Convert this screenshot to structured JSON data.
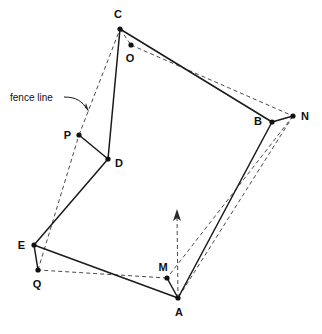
{
  "figure": {
    "background_color": "#ffffff",
    "solid_stroke_color": "#1a1a1a",
    "dashed_stroke_color": "#4a4a4a",
    "width": 322,
    "height": 334
  },
  "annotations": {
    "fence_line_label": "fence line"
  },
  "vertices": [
    {
      "label": "A",
      "x": 178,
      "y": 298,
      "label_x": 179,
      "label_y": 316,
      "anchor": "middle"
    },
    {
      "label": "B",
      "x": 272,
      "y": 122,
      "label_x": 262,
      "label_y": 125,
      "anchor": "end"
    },
    {
      "label": "C",
      "x": 120,
      "y": 29,
      "label_x": 118,
      "label_y": 18,
      "anchor": "middle"
    },
    {
      "label": "D",
      "x": 108,
      "y": 159,
      "label_x": 115,
      "label_y": 167,
      "anchor": "start"
    },
    {
      "label": "E",
      "x": 34,
      "y": 245,
      "label_x": 25,
      "label_y": 249,
      "anchor": "end"
    },
    {
      "label": "M",
      "x": 167,
      "y": 278,
      "label_x": 163,
      "label_y": 271,
      "anchor": "middle"
    },
    {
      "label": "N",
      "x": 293,
      "y": 116,
      "label_x": 301,
      "label_y": 120,
      "anchor": "start"
    },
    {
      "label": "O",
      "x": 131,
      "y": 45,
      "label_x": 130,
      "label_y": 62,
      "anchor": "middle"
    },
    {
      "label": "P",
      "x": 79,
      "y": 135,
      "label_x": 71,
      "label_y": 139,
      "anchor": "end"
    },
    {
      "label": "Q",
      "x": 38,
      "y": 270,
      "label_x": 37,
      "label_y": 288,
      "anchor": "middle"
    }
  ],
  "solid_edges": [
    {
      "name": "edge-C-B",
      "from": "C",
      "to": "B",
      "x1": 120,
      "y1": 29,
      "x2": 272,
      "y2": 122
    },
    {
      "name": "edge-B-N",
      "from": "B",
      "to": "N",
      "x1": 272,
      "y1": 122,
      "x2": 293,
      "y2": 116
    },
    {
      "name": "edge-B-A",
      "from": "B",
      "to": "A",
      "x1": 272,
      "y1": 122,
      "x2": 178,
      "y2": 298
    },
    {
      "name": "edge-A-M",
      "from": "A",
      "to": "M",
      "x1": 178,
      "y1": 298,
      "x2": 167,
      "y2": 278
    },
    {
      "name": "edge-A-E",
      "from": "A",
      "to": "E",
      "x1": 178,
      "y1": 298,
      "x2": 34,
      "y2": 245
    },
    {
      "name": "edge-E-Q",
      "from": "E",
      "to": "Q",
      "x1": 34,
      "y1": 245,
      "x2": 38,
      "y2": 270
    },
    {
      "name": "edge-E-D",
      "from": "E",
      "to": "D",
      "x1": 34,
      "y1": 245,
      "x2": 108,
      "y2": 159
    },
    {
      "name": "edge-D-P",
      "from": "D",
      "to": "P",
      "x1": 108,
      "y1": 159,
      "x2": 79,
      "y2": 135
    },
    {
      "name": "edge-D-C",
      "from": "D",
      "to": "C",
      "x1": 108,
      "y1": 159,
      "x2": 120,
      "y2": 29
    }
  ],
  "dashed_edges": [
    {
      "name": "dashed-C-O",
      "from": "C",
      "to": "O",
      "x1": 120,
      "y1": 29,
      "x2": 131,
      "y2": 45
    },
    {
      "name": "dashed-O-N",
      "from": "O",
      "to": "N",
      "x1": 131,
      "y1": 45,
      "x2": 293,
      "y2": 116
    },
    {
      "name": "dashed-N-A",
      "from": "N",
      "to": "A",
      "x1": 293,
      "y1": 116,
      "x2": 178,
      "y2": 298
    },
    {
      "name": "dashed-N-M",
      "from": "N",
      "to": "M",
      "x1": 293,
      "y1": 116,
      "x2": 167,
      "y2": 278
    },
    {
      "name": "dashed-M-Q",
      "from": "M",
      "to": "Q",
      "x1": 167,
      "y1": 278,
      "x2": 38,
      "y2": 270
    },
    {
      "name": "dashed-Q-P",
      "from": "Q",
      "to": "P",
      "x1": 38,
      "y1": 270,
      "x2": 79,
      "y2": 135
    },
    {
      "name": "dashed-P-C",
      "from": "P",
      "to": "C",
      "x1": 79,
      "y1": 135,
      "x2": 120,
      "y2": 29
    }
  ],
  "north_arrow": {
    "name": "north-arrow",
    "shaft_x1": 178,
    "shaft_y1": 298,
    "shaft_x2": 177,
    "shaft_y2": 214,
    "head_points": "177,209 173,221 177,218 181,221"
  },
  "leader": {
    "name": "fence-line-leader",
    "path": "M 64 97 C 76 97, 82 101, 88 110",
    "head_points": "89,112 82,104 85,107 86,103"
  },
  "label_position": {
    "fence_line_x": 10,
    "fence_line_y": 101
  }
}
